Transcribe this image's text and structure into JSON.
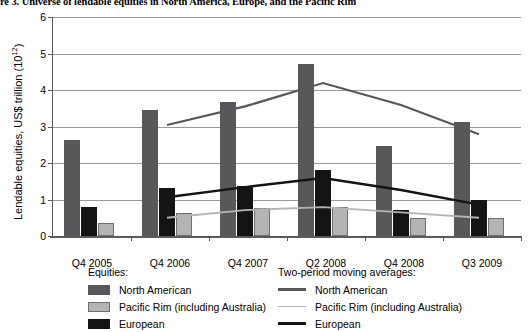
{
  "figure": {
    "title": "re 3. Universe of lendable equities in North America, Europe, and the Pacific Rim"
  },
  "axes": {
    "ylabel_text": "Lendable equities, US$ trillion (10",
    "ylabel_exponent": "12",
    "ylabel_close": ")",
    "yticks": [
      "0",
      "1",
      "2",
      "3",
      "4",
      "5",
      "6"
    ]
  },
  "legend_left": {
    "title": "Equities:",
    "items": [
      {
        "label": "North American",
        "color": "#58585a"
      },
      {
        "label": "Pacific Rim (including Australia)",
        "color": "#b4b4b4"
      },
      {
        "label": "European",
        "color": "#141414"
      }
    ]
  },
  "legend_right": {
    "title": "Two-period moving averages:",
    "items": [
      {
        "label": "North American",
        "color": "#58585a"
      },
      {
        "label": "Pacific Rim (including Australia)",
        "color": "#b4b4b4"
      },
      {
        "label": "European",
        "color": "#141414"
      }
    ]
  },
  "chart_data": {
    "type": "bar",
    "title": "re 3. Universe of lendable equities in North America, Europe, and the Pacific Rim",
    "xlabel": "",
    "ylabel": "Lendable equities, US$ trillion (10^12)",
    "ylim": [
      0,
      6
    ],
    "ytick_values": [
      0,
      1,
      2,
      3,
      4,
      5,
      6
    ],
    "grid": "horizontal",
    "legend_position": "below-plot-two-columns",
    "categories": [
      "Q4 2005",
      "Q4 2006",
      "Q4 2007",
      "Q2 2008",
      "Q4 2008",
      "Q3 2009"
    ],
    "series": [
      {
        "name": "North American",
        "type": "bar",
        "color": "#58585a",
        "values": [
          2.62,
          3.45,
          3.66,
          4.72,
          2.46,
          3.12
        ]
      },
      {
        "name": "European",
        "type": "bar",
        "color": "#141414",
        "values": [
          0.8,
          1.31,
          1.37,
          1.8,
          0.72,
          1.0
        ]
      },
      {
        "name": "Pacific Rim (including Australia)",
        "type": "bar",
        "color": "#b4b4b4",
        "values": [
          0.37,
          0.63,
          0.78,
          0.8,
          0.5,
          0.49
        ]
      },
      {
        "name": "North American (two-period moving average)",
        "type": "line",
        "color": "#58585a",
        "values": [
          null,
          3.04,
          3.55,
          4.19,
          3.59,
          2.79
        ]
      },
      {
        "name": "European (two-period moving average)",
        "type": "line",
        "color": "#141414",
        "values": [
          null,
          1.06,
          1.34,
          1.59,
          1.26,
          0.86
        ]
      },
      {
        "name": "Pacific Rim (including Australia) (two-period moving average)",
        "type": "line",
        "color": "#b4b4b4",
        "values": [
          null,
          0.5,
          0.71,
          0.79,
          0.65,
          0.5
        ]
      }
    ]
  }
}
